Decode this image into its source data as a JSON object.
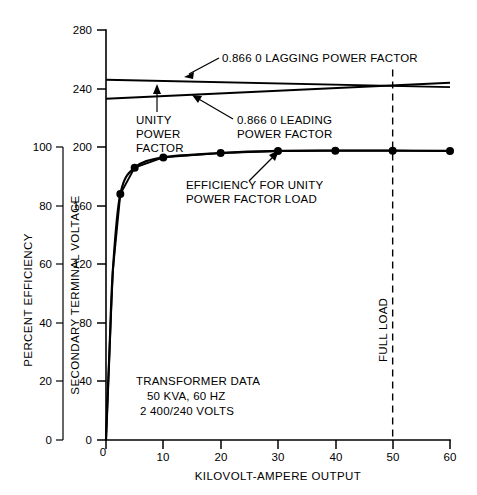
{
  "chart_data": {
    "type": "line",
    "title": "",
    "xlabel": "KILOVOLT-AMPERE OUTPUT",
    "xlim": [
      0,
      60
    ],
    "xticks": [
      0,
      10,
      20,
      30,
      40,
      50,
      60
    ],
    "xticklabels": [
      "0",
      "10",
      "20",
      "30",
      "40",
      "50",
      "60"
    ],
    "grid": false,
    "legend": "none (inline annotations)",
    "axes": [
      {
        "id": "efficiency",
        "label": "PERCENT EFFICIENCY",
        "position": "left-outer",
        "lim": [
          0,
          100
        ],
        "ticks": [
          0,
          20,
          40,
          60,
          80,
          100
        ],
        "ticklabels": [
          "0",
          "20",
          "40",
          "60",
          "80",
          "100"
        ]
      },
      {
        "id": "voltage",
        "label": "SECONDARY TERMINAL VOLTAGE",
        "position": "left-inner",
        "lim": [
          0,
          280
        ],
        "ticks": [
          0,
          40,
          80,
          120,
          160,
          200,
          240,
          280
        ],
        "ticklabels": [
          "0",
          "40",
          "80",
          "120",
          "160",
          "200",
          "240",
          "280"
        ]
      }
    ],
    "series": [
      {
        "name": "EFFICIENCY FOR UNITY POWER FACTOR LOAD",
        "axis": "efficiency",
        "x": [
          0,
          0.6,
          1.2,
          2.5,
          5,
          10,
          20,
          30,
          40,
          50,
          60
        ],
        "values": [
          0,
          30,
          58,
          84,
          93,
          96.5,
          98,
          98.7,
          98.8,
          98.8,
          98.7
        ],
        "markers_x": [
          2.5,
          5,
          10,
          20,
          30,
          40,
          50,
          60
        ],
        "markers_y": [
          84,
          93,
          96.5,
          98,
          98.7,
          98.8,
          98.8,
          98.7
        ],
        "marker": "filled-circle"
      },
      {
        "name": "0.866 0 LAGGING POWER FACTOR",
        "axis": "voltage",
        "x": [
          0,
          60
        ],
        "values": [
          246,
          241
        ]
      },
      {
        "name": "UNITY POWER FACTOR",
        "axis": "voltage",
        "x": [
          0,
          60
        ],
        "values": [
          243,
          242
        ]
      },
      {
        "name": "0.866 0 LEADING POWER FACTOR",
        "axis": "voltage",
        "x": [
          0,
          60
        ],
        "values": [
          233,
          244
        ]
      }
    ],
    "reference_lines": [
      {
        "name": "FULL LOAD",
        "orientation": "vertical",
        "x": 50,
        "style": "dashed"
      }
    ],
    "annotations": [
      {
        "id": "lagging",
        "text": "0.866 0 LAGGING POWER FACTOR"
      },
      {
        "id": "leading",
        "text": "0.866 0 LEADING\nPOWER FACTOR"
      },
      {
        "id": "unity",
        "text": "UNITY\nPOWER\nFACTOR"
      },
      {
        "id": "efficiency",
        "text": "EFFICIENCY FOR UNITY\nPOWER FACTOR LOAD"
      },
      {
        "id": "fullload",
        "text": "FULL LOAD"
      }
    ],
    "textbox": {
      "id": "transformer-data",
      "lines": [
        "TRANSFORMER DATA",
        "50 KVA, 60 HZ",
        "2 400/240 VOLTS"
      ]
    },
    "colors": {
      "ink": "#000000",
      "paper": "#ffffff"
    }
  },
  "labels": {
    "x_axis_title": "KILOVOLT-AMPERE OUTPUT",
    "y_axis_efficiency_title": "PERCENT EFFICIENCY",
    "y_axis_voltage_title": "SECONDARY TERMINAL VOLTAGE",
    "annot_lagging": "0.866 0 LAGGING POWER FACTOR",
    "annot_leading_l1": "0.866 0 LEADING",
    "annot_leading_l2": "POWER FACTOR",
    "annot_unity_l1": "UNITY",
    "annot_unity_l2": "POWER",
    "annot_unity_l3": "FACTOR",
    "annot_eff_l1": "EFFICIENCY FOR UNITY",
    "annot_eff_l2": "POWER FACTOR LOAD",
    "annot_fullload": "FULL LOAD",
    "data_l1": "TRANSFORMER DATA",
    "data_l2": "50 KVA, 60 HZ",
    "data_l3": "2 400/240 VOLTS"
  },
  "ticks": {
    "x": [
      "0",
      "10",
      "20",
      "30",
      "40",
      "50",
      "60"
    ],
    "efficiency": [
      "0",
      "20",
      "40",
      "60",
      "80",
      "100"
    ],
    "voltage": [
      "0",
      "40",
      "80",
      "120",
      "160",
      "200",
      "240",
      "280"
    ]
  }
}
